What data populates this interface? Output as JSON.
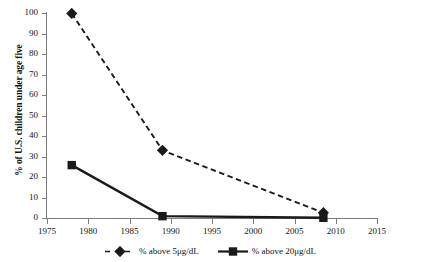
{
  "chart_data": {
    "type": "line",
    "title": "",
    "xlabel": "",
    "ylabel": "% of U.S. children under age five",
    "xlim": [
      1975,
      2015
    ],
    "ylim": [
      0,
      100
    ],
    "grid": false,
    "legend_position": "bottom",
    "x_ticks": [
      "1975",
      "1980",
      "1985",
      "1990",
      "1995",
      "2000",
      "2005",
      "2010",
      "2015"
    ],
    "x_tick_values": [
      1975,
      1980,
      1985,
      1990,
      1995,
      2000,
      2005,
      2010,
      2015
    ],
    "y_ticks": [
      "0",
      "10",
      "20",
      "30",
      "40",
      "50",
      "60",
      "70",
      "80",
      "90",
      "100"
    ],
    "y_tick_values": [
      0,
      10,
      20,
      30,
      40,
      50,
      60,
      70,
      80,
      90,
      100
    ],
    "series": [
      {
        "name": "% above 5μg/dL",
        "marker": "diamond",
        "linestyle": "dashed",
        "color": "#1a1a1a",
        "x": [
          1978,
          1989,
          2008.5
        ],
        "values": [
          99.8,
          33,
          2.6
        ]
      },
      {
        "name": "% above 20μg/dL",
        "marker": "square",
        "linestyle": "solid",
        "color": "#1a1a1a",
        "x": [
          1978,
          1989,
          2008.5
        ],
        "values": [
          25.8,
          0.9,
          0.1
        ]
      }
    ]
  },
  "legend": {
    "items": [
      {
        "label": "% above 5μg/dL",
        "marker": "diamond",
        "linestyle": "dashed"
      },
      {
        "label": "% above 20μg/dL",
        "marker": "square",
        "linestyle": "solid"
      }
    ]
  },
  "colors": {
    "series": "#1a1a1a",
    "axis": "#7d7d7d",
    "text": "#141414",
    "background": "#ffffff"
  }
}
